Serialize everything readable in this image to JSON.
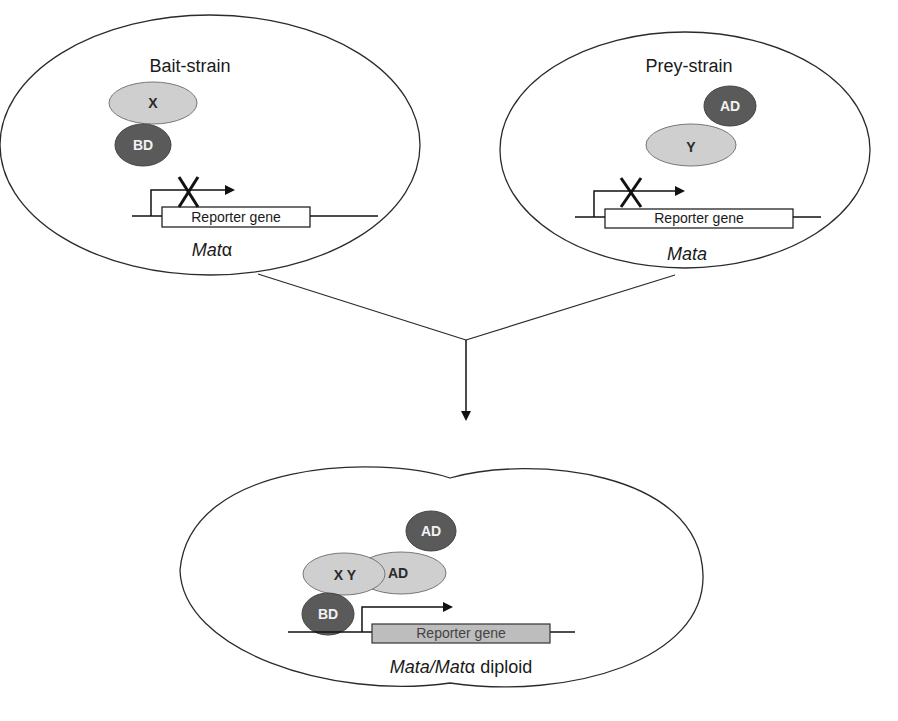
{
  "diagram": {
    "type": "yeast-two-hybrid-mating",
    "colors": {
      "outline": "#2b2b2b",
      "light_protein": "#cfcfcf",
      "dark_protein": "#5a5a5a",
      "reporter_active": "#bdbdbd",
      "reporter_inactive": "#ffffff"
    },
    "bait_cell": {
      "title": "Bait-strain",
      "protein_x": "X",
      "binding_domain": "BD",
      "blocked_mark": "X",
      "reporter": "Reporter gene",
      "mating_type_prefix": "Mat",
      "mating_type_symbol": "α"
    },
    "prey_cell": {
      "title": "Prey-strain",
      "activation_domain": "AD",
      "protein_y": "Y",
      "blocked_mark": "X",
      "reporter": "Reporter gene",
      "mating_type": "Mata"
    },
    "diploid_cell": {
      "activation_domain_top": "AD",
      "protein_xy": "X Y",
      "activation_domain_mid": "AD",
      "binding_domain": "BD",
      "reporter": "Reporter gene",
      "mating_type_italic": "Mata/Mat",
      "mating_type_symbol": "α",
      "mating_type_suffix": " diploid"
    }
  }
}
